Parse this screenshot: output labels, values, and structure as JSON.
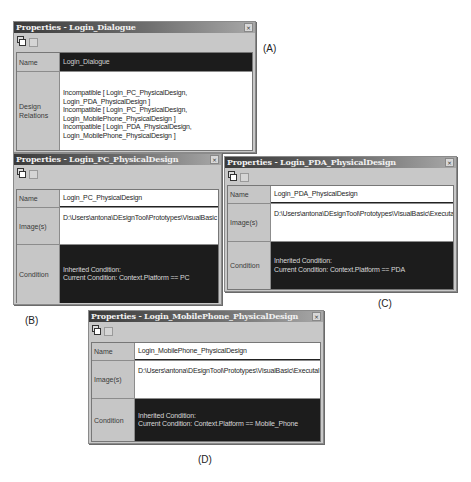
{
  "panels": {
    "a": {
      "title": "Properties - Login_Dialogue",
      "close_label": "×",
      "rows": {
        "name": {
          "label": "Name",
          "value": "Login_Dialogue"
        },
        "design_relations": {
          "label_line1": "Design",
          "label_line2": "Relations",
          "lines": [
            "Incompatible [ Login_PC_PhysicalDesign,",
            "Login_PDA_PhysicalDesign ]",
            "Incompatible [ Login_PC_PhysicalDesign,",
            "Login_MobilePhone_PhysicalDesign ]",
            "Incompatible [ Login_PDA_PhysicalDesign,",
            "Login_MobilePhone_PhysicalDesign ]"
          ]
        }
      },
      "caption": "(A)"
    },
    "b": {
      "title": "Properties - Login_PC_PhysicalDesign",
      "close_label": "×",
      "rows": {
        "name": {
          "label": "Name",
          "value": "Login_PC_PhysicalDesign"
        },
        "images": {
          "label": "Image(s)",
          "value": "D:\\Users\\antona\\DEsignTool\\Prototypes\\VisualBasic"
        },
        "condition": {
          "label": "Condition",
          "line1": "Inherited Condition:",
          "line2": "Current Condition: Context.Platform == PC"
        }
      },
      "caption": "(B)"
    },
    "c": {
      "title": "Properties - Login_PDA_PhysicalDesign",
      "close_label": "×",
      "rows": {
        "name": {
          "label": "Name",
          "value": "Login_PDA_PhysicalDesign"
        },
        "images": {
          "label": "Image(s)",
          "value": "D:\\Users\\antona\\DEsignTool\\Prototypes\\VisualBasic\\Executal"
        },
        "condition": {
          "label": "Condition",
          "line1": "Inherited Condition:",
          "line2": "Current Condition: Context.Platform == PDA"
        }
      },
      "caption": "(C)"
    },
    "d": {
      "title": "Properties - Login_MobilePhone_PhysicalDesign",
      "close_label": "×",
      "rows": {
        "name": {
          "label": "Name",
          "value": "Login_MobilePhone_PhysicalDesign"
        },
        "images": {
          "label": "Image(s)",
          "value": "D:\\Users\\antona\\DEsignTool\\Prototypes\\VisualBasic\\Executal"
        },
        "condition": {
          "label": "Condition",
          "line1": "Inherited Condition:",
          "line2": "Current Condition: Context.Platform == Mobile_Phone"
        }
      },
      "caption": "(D)"
    }
  },
  "icons": {
    "properties": "properties-pages-icon",
    "grid": "property-grid-icon",
    "close": "close-icon"
  },
  "colors": {
    "title_gradient_start": "#3a3a3a",
    "panel_bg": "#c8c8c8",
    "dark_cell": "#1c1c1c",
    "white_cell": "#ffffff"
  }
}
